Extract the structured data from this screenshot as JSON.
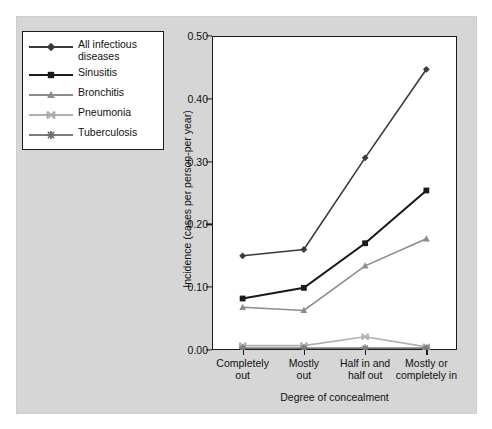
{
  "chart_data": {
    "type": "line",
    "title": "",
    "xlabel": "Degree of concealment",
    "ylabel": "Incidence (cases per person-per year)",
    "categories": [
      "Completely\nout",
      "Mostly\nout",
      "Half in and\nhalf out",
      "Mostly or\ncompletely in"
    ],
    "ylim": [
      0.0,
      0.5
    ],
    "yticks": [
      "0.00",
      "0.10",
      "0.20",
      "0.30",
      "0.40",
      "0.50"
    ],
    "ytick_values": [
      0.0,
      0.1,
      0.2,
      0.3,
      0.4,
      0.5
    ],
    "grid": false,
    "legend_position": "outside-upper-left",
    "series": [
      {
        "name": "All infectious diseases",
        "marker": "diamond",
        "color": "#3a3a3a",
        "values": [
          0.15,
          0.16,
          0.306,
          0.447
        ]
      },
      {
        "name": "Sinusitis",
        "marker": "square",
        "color": "#1a1a1a",
        "values": [
          0.082,
          0.099,
          0.17,
          0.254
        ]
      },
      {
        "name": "Bronchitis",
        "marker": "triangle",
        "color": "#8c8c8c",
        "values": [
          0.068,
          0.063,
          0.134,
          0.177
        ]
      },
      {
        "name": "Pneumonia",
        "marker": "x-cross",
        "color": "#b0b0b0",
        "values": [
          0.007,
          0.007,
          0.021,
          0.005
        ]
      },
      {
        "name": "Tuberculosis",
        "marker": "asterisk",
        "color": "#7a7a7a",
        "values": [
          0.003,
          0.003,
          0.003,
          0.003
        ]
      }
    ]
  },
  "legend": {
    "entries": [
      {
        "label": "All infectious diseases"
      },
      {
        "label": "Sinusitis"
      },
      {
        "label": "Bronchitis"
      },
      {
        "label": "Pneumonia"
      },
      {
        "label": "Tuberculosis"
      }
    ]
  },
  "colors": {
    "figure_background": "#d6d6d6",
    "plot_background": "#ffffff",
    "axis": "#1a1a1a",
    "page": "#ffffff"
  }
}
